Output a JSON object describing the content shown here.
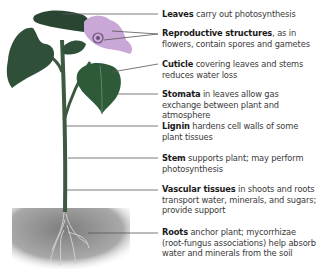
{
  "diagram": {
    "labels": [
      {
        "term": "Leaves",
        "desc": " carry out photosynthesis",
        "y": 9
      },
      {
        "term": "Reproductive structures",
        "desc": ", as in flowers, contain spores and gametes",
        "y": 28
      },
      {
        "term": "Cuticle",
        "desc": " covering leaves and stems reduces water loss",
        "y": 60
      },
      {
        "term": "Stomata",
        "desc": " in leaves allow gas exchange between plant and atmosphere",
        "y": 90
      },
      {
        "term": "Lignin",
        "desc": " hardens cell walls of some plant tissues",
        "y": 122
      },
      {
        "term": "Stem",
        "desc": "  supports plant; may perform photosynthesis",
        "y": 155
      },
      {
        "term": "Vascular tissues",
        "desc": " in shoots and roots transport water, minerals, and sugars; provide support",
        "y": 185
      },
      {
        "term": "Roots",
        "desc": " anchor plant; mycorrhizae (root-fungus associations) help absorb water and minerals from the soil",
        "y": 228
      }
    ],
    "colors": {
      "leaf": "#2f5a3a",
      "leaf_light": "#5d8a63",
      "stem": "#3d5a40",
      "flower": "#c9a8d8",
      "soil": "#8a8a8a",
      "line": "#555555"
    }
  }
}
